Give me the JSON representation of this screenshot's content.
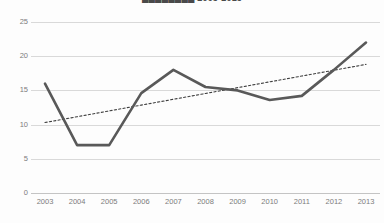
{
  "chart_data": {
    "type": "line",
    "title": "████████ 2003-2013",
    "xlabel": "",
    "ylabel": "",
    "categories": [
      "2003",
      "2004",
      "2005",
      "2006",
      "2007",
      "2008",
      "2009",
      "2010",
      "2011",
      "2012",
      "2013"
    ],
    "series": [
      {
        "name": "value",
        "style": "solid",
        "color": "#595959",
        "values": [
          16,
          7,
          7,
          14.6,
          18,
          15.5,
          15,
          13.6,
          14.2,
          18,
          22
        ]
      },
      {
        "name": "trendline",
        "style": "dotted",
        "color": "#3f3f3f",
        "values": [
          10.3,
          11.15,
          12,
          12.85,
          13.7,
          14.55,
          15.4,
          16.25,
          17.1,
          17.95,
          18.8
        ]
      }
    ],
    "ylim": [
      0,
      25
    ],
    "yticks": [
      0,
      5,
      10,
      15,
      20,
      25
    ],
    "ytick_labels": [
      "0",
      "5",
      "10",
      "15",
      "20",
      "25"
    ],
    "grid": true,
    "legend": "none",
    "background": "#fdfdfd",
    "gridline_color": "#d9d9d9"
  }
}
